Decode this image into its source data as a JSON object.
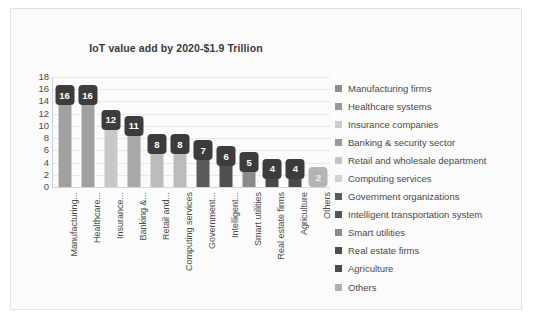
{
  "chart_data": {
    "type": "bar",
    "title": "IoT value add by 2020-$1.9 Trillion",
    "xlabel": "",
    "ylabel": "",
    "ylim": [
      0,
      18
    ],
    "yticks": [
      18,
      16,
      14,
      12,
      10,
      8,
      6,
      4,
      2,
      0
    ],
    "grid": true,
    "legend_position": "right",
    "categories": [
      "Manufacturing...",
      "Healthcare...",
      "Insurance...",
      "Banking &...",
      "Retail and...",
      "Computing services",
      "Government...",
      "Intelligent...",
      "Smart utilities",
      "Real estate firms",
      "Agriculture",
      "Others"
    ],
    "values": [
      16,
      16,
      12,
      11,
      8,
      8,
      7,
      6,
      5,
      4,
      4,
      2
    ],
    "data_labels": [
      "16",
      "16",
      "12",
      "11",
      "8",
      "8",
      "7",
      "6",
      "5",
      "4",
      "4",
      "2"
    ],
    "bar_colors": [
      "#a0a0a0",
      "#a0a0a0",
      "#c8c8c8",
      "#a8a8a8",
      "#bcbcbc",
      "#bcbcbc",
      "#5a5a5a",
      "#4f4f4f",
      "#8a8a8a",
      "#4a4a4a",
      "#4a4a4a",
      "#b4b4b4"
    ],
    "label_box_colors": [
      "#3c3c3c",
      "#3c3c3c",
      "#3c3c3c",
      "#3c3c3c",
      "#3c3c3c",
      "#3c3c3c",
      "#3c3c3c",
      "#3c3c3c",
      "#3c3c3c",
      "#3c3c3c",
      "#3c3c3c",
      "#b4b4b4"
    ],
    "label_text_colors": [
      "#ffffff",
      "#ffffff",
      "#ffffff",
      "#ffffff",
      "#ffffff",
      "#ffffff",
      "#ffffff",
      "#ffffff",
      "#ffffff",
      "#ffffff",
      "#ffffff",
      "#f2f2f2"
    ]
  },
  "legend": {
    "items": [
      {
        "label": "Manufacturing firms",
        "color": "#8f8f8f"
      },
      {
        "label": "Healthcare systems",
        "color": "#9a9a9a"
      },
      {
        "label": "Insurance companies",
        "color": "#cccccc"
      },
      {
        "label": "Banking & security sector",
        "color": "#999999"
      },
      {
        "label": "Retail and wholesale department",
        "color": "#c4c4c4"
      },
      {
        "label": "Computing services",
        "color": "#d2d2d2"
      },
      {
        "label": "Government organizations",
        "color": "#5c5c5c"
      },
      {
        "label": "Intelligent transportation system",
        "color": "#545454"
      },
      {
        "label": "Smart utilities",
        "color": "#8a8a8a"
      },
      {
        "label": "Real estate firms",
        "color": "#4d4d4d"
      },
      {
        "label": "Agriculture",
        "color": "#4a4a4a"
      },
      {
        "label": "Others",
        "color": "#b0b0b0"
      }
    ]
  }
}
